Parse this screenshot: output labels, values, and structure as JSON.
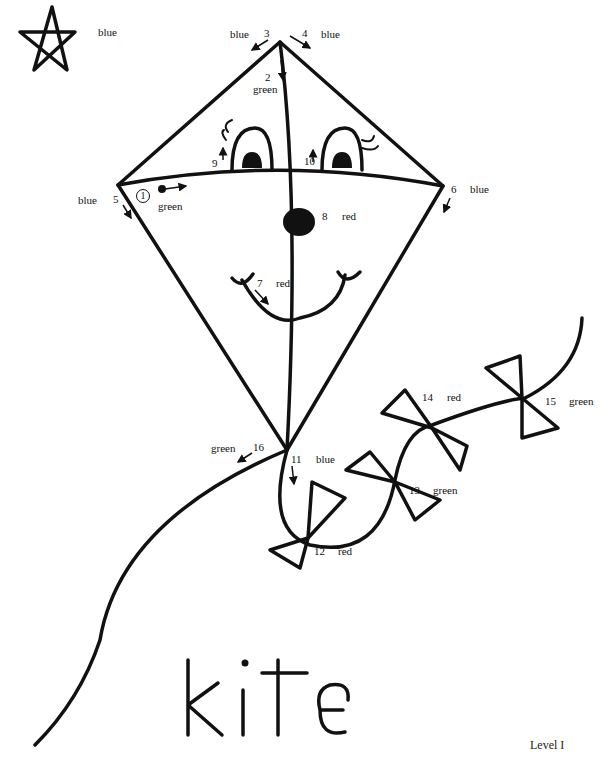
{
  "worksheet": {
    "word": "kite",
    "level": "Level I",
    "legend_star": {
      "color_label": "blue"
    },
    "steps": [
      {
        "n": "1",
        "color": "green"
      },
      {
        "n": "2",
        "color": "green"
      },
      {
        "n": "3",
        "color": "blue"
      },
      {
        "n": "4",
        "color": "blue"
      },
      {
        "n": "5",
        "color": "blue"
      },
      {
        "n": "6",
        "color": "blue"
      },
      {
        "n": "7",
        "color": "red"
      },
      {
        "n": "8",
        "color": "red"
      },
      {
        "n": "9",
        "color": ""
      },
      {
        "n": "10",
        "color": ""
      },
      {
        "n": "11",
        "color": "blue"
      },
      {
        "n": "12",
        "color": "red"
      },
      {
        "n": "13",
        "color": "green"
      },
      {
        "n": "14",
        "color": "red"
      },
      {
        "n": "15",
        "color": "green"
      },
      {
        "n": "16",
        "color": "green"
      }
    ]
  },
  "colors": {
    "ink": "#111111",
    "paper": "#ffffff"
  }
}
